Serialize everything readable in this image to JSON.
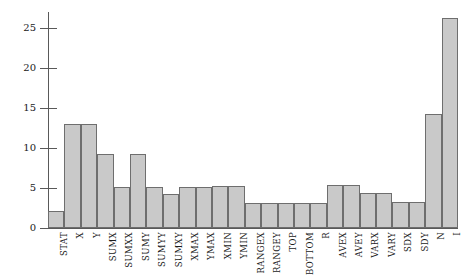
{
  "chart_data": {
    "type": "bar",
    "title": "",
    "subtitle": "",
    "xlabel": "",
    "ylabel": "",
    "xlim_categories": 24,
    "ylim": [
      0,
      27
    ],
    "grid": false,
    "legend": "none",
    "y_ticks": [
      0,
      5,
      10,
      15,
      20,
      25
    ],
    "y_tick_labels": [
      "0",
      "5",
      "10",
      "15",
      "20",
      "25"
    ],
    "categories": [
      "STAT",
      "X",
      "Y",
      "SUMX",
      "SUMXX",
      "SUMY",
      "SUMYY",
      "SUMXY",
      "XMAX",
      "YMAX",
      "XMIN",
      "YMIN",
      "RANGEX",
      "RANGEY",
      "TOP",
      "BOTTOM",
      "R",
      "AVEX",
      "AVEY",
      "VARX",
      "VARY",
      "SDX",
      "SDY",
      "N",
      "I"
    ],
    "values": [
      2.1,
      13.0,
      13.0,
      9.2,
      5.1,
      9.3,
      5.15,
      4.3,
      5.15,
      5.15,
      5.2,
      5.25,
      3.1,
      3.1,
      3.1,
      3.1,
      3.1,
      5.35,
      5.35,
      4.4,
      4.4,
      3.2,
      3.2,
      14.3,
      26.2
    ],
    "bar_color": "#c9c9c9",
    "bar_edge_color": "#6e6e6e",
    "axis_color": "#595959",
    "background_color": "#ffffff"
  }
}
